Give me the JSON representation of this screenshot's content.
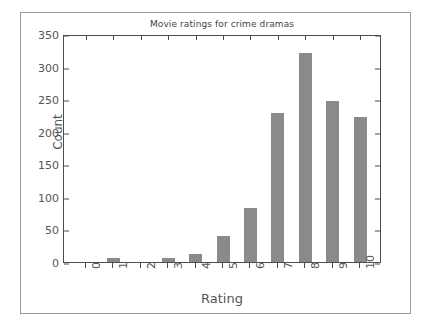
{
  "chart_data": {
    "type": "bar",
    "title": "Movie ratings for crime dramas",
    "xlabel": "Rating",
    "ylabel": "Count",
    "categories": [
      "0",
      "1",
      "2",
      "3",
      "4",
      "5",
      "6",
      "7",
      "8",
      "9",
      "10"
    ],
    "values": [
      0,
      6,
      0,
      6,
      12,
      40,
      83,
      229,
      321,
      247,
      223
    ],
    "ylim": [
      0,
      350
    ],
    "yticks": [
      0,
      50,
      100,
      150,
      200,
      250,
      300,
      350
    ],
    "ytick_labels": [
      "0",
      "50",
      "100",
      "150",
      "200",
      "250",
      "300",
      "350"
    ],
    "xtick_rotation": 90,
    "grid": false,
    "legend": null,
    "bar_color": "#8a8a8a",
    "axis_color": "#4d4d4d",
    "text_color": "#555555",
    "background": "#ffffff"
  }
}
